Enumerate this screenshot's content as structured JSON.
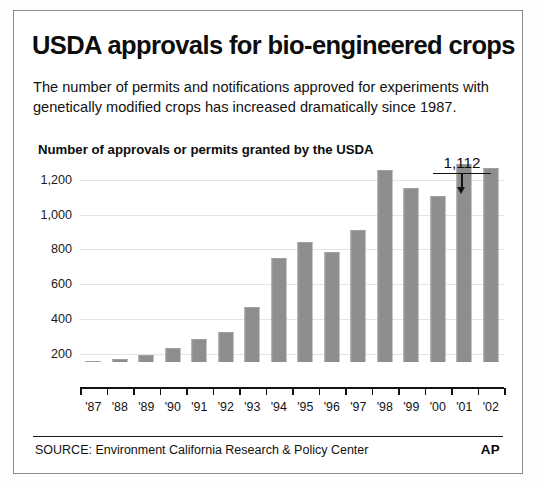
{
  "headline": "USDA approvals for bio-engineered crops",
  "deck": "The number of permits and notifications approved for experiments with genetically modified crops has increased dramatically since 1987.",
  "axis_title": "Number of approvals or permits granted by the USDA",
  "callout": {
    "value": "1,112",
    "points_to": "'02"
  },
  "footer": {
    "source": "SOURCE: Environment California Research & Policy Center",
    "logo": "AP"
  },
  "colors": {
    "bar": "#8e8e8e",
    "gridline": "#e4e4e4",
    "axis": "#121212",
    "text": "#111111",
    "frame": "#8d8d8d"
  },
  "chart_data": {
    "type": "bar",
    "title": "USDA approvals for bio-engineered crops",
    "subtitle": "The number of permits and notifications approved for experiments with genetically modified crops has increased dramatically since 1987.",
    "xlabel": "",
    "ylabel": "Number of approvals or permits granted by the USDA",
    "categories": [
      "'87",
      "'88",
      "'89",
      "'90",
      "'91",
      "'92",
      "'93",
      "'94",
      "'95",
      "'96",
      "'97",
      "'98",
      "'99",
      "'00",
      "'01",
      "'02"
    ],
    "values": [
      5,
      18,
      42,
      78,
      130,
      172,
      315,
      598,
      688,
      632,
      757,
      1100,
      1000,
      950,
      1135,
      1112
    ],
    "ylim": [
      0,
      1250
    ],
    "yticks": [
      200,
      400,
      600,
      800,
      1000,
      1200
    ],
    "ytick_labels": [
      "200",
      "400",
      "600",
      "800",
      "1,000",
      "1,200"
    ],
    "grid": true,
    "legend": false,
    "annotations": [
      {
        "label": "1,112",
        "category": "'02",
        "value": 1112
      }
    ]
  }
}
